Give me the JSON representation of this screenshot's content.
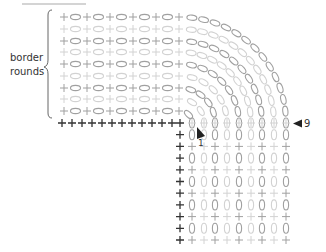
{
  "diagram": {
    "type": "knitting-stitch-chart",
    "annotation_label": "border\nrounds",
    "annotation_line1": "border",
    "annotation_line2": "rounds",
    "marker_start_label": "1",
    "marker_end_label": "9",
    "colors": {
      "dark_row": "#a0a0a0",
      "light_row": "#d2d2d2",
      "bold_plus": "#333333",
      "marker": "#222222",
      "top_rule": "#d4d4d4"
    },
    "corner": {
      "x": 180,
      "y": 123
    },
    "border_rounds": 9,
    "round_offsets_px": [
      106,
      94,
      82,
      71,
      59,
      47,
      35,
      24,
      12
    ],
    "horizontal_section": {
      "x_start": 64,
      "step": 11.5,
      "x_end": 180
    },
    "vertical_section": {
      "y_start": 123,
      "step": 11.7,
      "y_end": 246
    },
    "legend_symbols": {
      "plus": "+",
      "oval": "0"
    }
  }
}
